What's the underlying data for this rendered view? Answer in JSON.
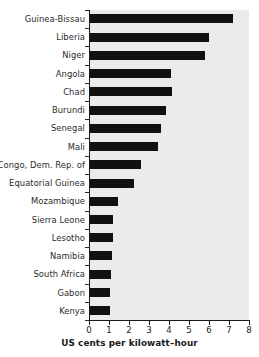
{
  "chart_data": {
    "type": "bar",
    "orientation": "horizontal",
    "title": "",
    "xlabel": "US cents per kilowatt–hour",
    "ylabel": "",
    "xlim": [
      0,
      8
    ],
    "xticks": [
      0,
      1,
      2,
      3,
      4,
      5,
      6,
      7,
      8
    ],
    "xtick_labels": [
      "0",
      "1",
      "2",
      "3",
      "4",
      "5",
      "6",
      "7",
      "8"
    ],
    "grid": false,
    "legend": null,
    "bar_color": "#111111",
    "plot_background": "#ebebeb",
    "figure_background": "#ffffff",
    "categories": [
      "Guinea-Bissau",
      "Liberia",
      "Niger",
      "Angola",
      "Chad",
      "Burundi",
      "Senegal",
      "Mali",
      "Congo, Dem. Rep. of",
      "Equatorial Guinea",
      "Mozambique",
      "Sierra Leone",
      "Lesotho",
      "Namibia",
      "South Africa",
      "Gabon",
      "Kenya"
    ],
    "values": [
      7.2,
      6.0,
      5.8,
      4.1,
      4.15,
      3.85,
      3.6,
      3.45,
      2.6,
      2.25,
      1.45,
      1.2,
      1.2,
      1.15,
      1.1,
      1.05,
      1.05
    ]
  }
}
